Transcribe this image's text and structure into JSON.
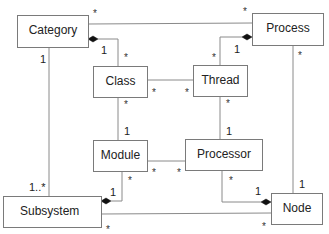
{
  "diagram": {
    "type": "UML class diagram",
    "classes": [
      {
        "id": "category",
        "name": "Category"
      },
      {
        "id": "process",
        "name": "Process"
      },
      {
        "id": "class",
        "name": "Class"
      },
      {
        "id": "thread",
        "name": "Thread"
      },
      {
        "id": "module",
        "name": "Module"
      },
      {
        "id": "processor",
        "name": "Processor"
      },
      {
        "id": "subsystem",
        "name": "Subsystem"
      },
      {
        "id": "node",
        "name": "Node"
      }
    ],
    "associations": [
      {
        "from": "Category",
        "to": "Process",
        "from_mult": "*",
        "to_mult": "*",
        "kind": "association"
      },
      {
        "from": "Category",
        "to": "Class",
        "from_mult": "1",
        "to_mult": "*",
        "kind": "composition"
      },
      {
        "from": "Process",
        "to": "Thread",
        "from_mult": "1",
        "to_mult": "*",
        "kind": "composition"
      },
      {
        "from": "Class",
        "to": "Thread",
        "from_mult": "*",
        "to_mult": "*",
        "kind": "association"
      },
      {
        "from": "Class",
        "to": "Module",
        "from_mult": "*",
        "to_mult": "1",
        "kind": "association"
      },
      {
        "from": "Thread",
        "to": "Processor",
        "from_mult": "*",
        "to_mult": "1",
        "kind": "association"
      },
      {
        "from": "Module",
        "to": "Processor",
        "from_mult": "*",
        "to_mult": "*",
        "kind": "association"
      },
      {
        "from": "Category",
        "to": "Subsystem",
        "from_mult": "1",
        "to_mult": "1..*",
        "kind": "association"
      },
      {
        "from": "Subsystem",
        "to": "Module",
        "from_mult": "1",
        "to_mult": "*",
        "kind": "composition"
      },
      {
        "from": "Node",
        "to": "Processor",
        "from_mult": "1",
        "to_mult": "*",
        "kind": "composition"
      },
      {
        "from": "Process",
        "to": "Node",
        "from_mult": "*",
        "to_mult": "1",
        "kind": "association"
      },
      {
        "from": "Subsystem",
        "to": "Node",
        "from_mult": "*",
        "to_mult": "*",
        "kind": "association"
      }
    ]
  },
  "labels": {
    "star": "*",
    "one": "1",
    "one_many": "1..*"
  }
}
